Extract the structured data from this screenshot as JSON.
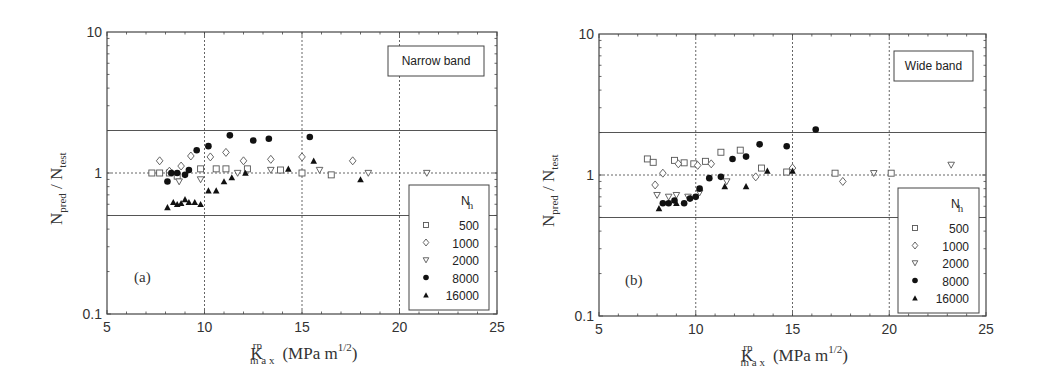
{
  "chart_data": [
    {
      "type": "scatter",
      "panel": "(a)",
      "annotation": "Narrow band",
      "xlabel": "K_max^rp (MPa m^1/2)",
      "ylabel": "N_pred / N_test",
      "xlim": [
        5,
        25
      ],
      "ylim": [
        0.1,
        10
      ],
      "yscale": "log",
      "xticks": [
        "5",
        "10",
        "15",
        "20",
        "25"
      ],
      "yticks": [
        "0.1",
        "1",
        "10"
      ],
      "grid": "dotted at x=10,15,20 and y=1",
      "reference_lines": [
        2,
        0.5
      ],
      "legend_title": "N_h",
      "legend_position": "lower right",
      "series": [
        {
          "name": "500",
          "marker": "open-square",
          "x": [
            7.3,
            7.7,
            8.2,
            8.6,
            9.8,
            10.6,
            11.1,
            12.2,
            13.9,
            15.0,
            16.5
          ],
          "y": [
            1.0,
            1.0,
            1.0,
            0.95,
            1.07,
            1.07,
            1.07,
            1.07,
            1.05,
            1.0,
            0.97
          ]
        },
        {
          "name": "1000",
          "marker": "open-diamond",
          "x": [
            7.7,
            8.2,
            8.8,
            9.3,
            10.3,
            11.1,
            12.0,
            13.4,
            15.0,
            17.6
          ],
          "y": [
            1.22,
            1.03,
            1.12,
            1.32,
            1.3,
            1.4,
            1.22,
            1.25,
            1.3,
            1.22
          ]
        },
        {
          "name": "2000",
          "marker": "open-triangle-down",
          "x": [
            8.7,
            9.8,
            11.7,
            13.4,
            15.9,
            18.4,
            21.4
          ],
          "y": [
            0.87,
            0.9,
            1.0,
            1.05,
            1.05,
            1.0,
            1.0
          ]
        },
        {
          "name": "8000",
          "marker": "filled-circle",
          "x": [
            8.1,
            8.3,
            8.6,
            9.0,
            9.2,
            9.6,
            10.2,
            11.3,
            12.5,
            13.3,
            15.4
          ],
          "y": [
            0.87,
            1.0,
            1.0,
            0.97,
            1.05,
            1.45,
            1.55,
            1.85,
            1.7,
            1.75,
            1.8
          ]
        },
        {
          "name": "16000",
          "marker": "filled-triangle-up",
          "x": [
            8.1,
            8.4,
            8.6,
            8.8,
            9.0,
            9.2,
            9.5,
            9.8,
            10.2,
            10.6,
            11.0,
            11.4,
            12.1,
            14.3,
            15.6,
            18.0
          ],
          "y": [
            0.57,
            0.62,
            0.6,
            0.61,
            0.65,
            0.62,
            0.62,
            0.6,
            0.75,
            0.75,
            0.87,
            0.93,
            1.0,
            1.07,
            1.22,
            0.9
          ]
        }
      ]
    },
    {
      "type": "scatter",
      "panel": "(b)",
      "annotation": "Wide band",
      "xlabel": "K_max^rp (MPa m^1/2)",
      "ylabel": "N_pred / N_test",
      "xlim": [
        5,
        25
      ],
      "ylim": [
        0.1,
        10
      ],
      "yscale": "log",
      "xticks": [
        "5",
        "10",
        "15",
        "20",
        "25"
      ],
      "yticks": [
        "0.1",
        "1",
        "10"
      ],
      "grid": "dotted at x=10,15,20 and y=1",
      "reference_lines": [
        2,
        0.5
      ],
      "legend_title": "N_h",
      "legend_position": "lower right",
      "series": [
        {
          "name": "500",
          "marker": "open-square",
          "x": [
            7.5,
            7.8,
            8.9,
            9.4,
            9.9,
            10.5,
            11.3,
            12.3,
            13.4,
            14.7,
            17.2,
            20.1
          ],
          "y": [
            1.3,
            1.23,
            1.27,
            1.22,
            1.2,
            1.25,
            1.45,
            1.5,
            1.12,
            1.05,
            1.03,
            1.03
          ]
        },
        {
          "name": "1000",
          "marker": "open-diamond",
          "x": [
            7.9,
            8.3,
            9.1,
            10.1,
            10.8,
            13.1,
            15.0,
            17.6
          ],
          "y": [
            0.85,
            1.03,
            1.2,
            1.17,
            1.2,
            0.97,
            1.12,
            0.9
          ]
        },
        {
          "name": "2000",
          "marker": "open-triangle-down",
          "x": [
            8.0,
            8.6,
            9.0,
            9.6,
            10.2,
            11.6,
            19.2,
            23.2
          ],
          "y": [
            0.72,
            0.7,
            0.72,
            0.7,
            0.75,
            0.9,
            1.03,
            1.18
          ]
        },
        {
          "name": "8000",
          "marker": "filled-circle",
          "x": [
            8.3,
            8.6,
            8.9,
            9.4,
            9.7,
            10.0,
            10.2,
            10.7,
            11.3,
            11.9,
            12.6,
            13.3,
            14.7,
            16.2
          ],
          "y": [
            0.63,
            0.63,
            0.66,
            0.63,
            0.68,
            0.7,
            0.8,
            0.95,
            0.97,
            1.3,
            1.35,
            1.65,
            1.6,
            2.1
          ]
        },
        {
          "name": "16000",
          "marker": "filled-triangle-up",
          "x": [
            8.1,
            9.0,
            11.5,
            12.6,
            13.7,
            15.0
          ],
          "y": [
            0.58,
            0.63,
            0.83,
            0.83,
            1.07,
            1.07
          ]
        }
      ]
    }
  ],
  "panels": [
    {
      "tag": "(a)",
      "annotation": "Narrow band",
      "ylabel_main": "N",
      "ylabel_sub1": "pred",
      "ylabel_sep": " / ",
      "ylabel_main2": "N",
      "ylabel_sub2": "test",
      "xlabel_main": "K",
      "xlabel_sup": "rp",
      "xlabel_sub": "m a x",
      "xlabel_units": "(MPa m",
      "xlabel_units_sup": "1/2",
      "xlabel_units_close": ")",
      "xticks": [
        "5",
        "10",
        "15",
        "20",
        "25"
      ],
      "yticks": [
        "0.1",
        "1",
        "10"
      ],
      "legend_title_main": "N",
      "legend_title_sub": "h",
      "legend_items": [
        "500",
        "1000",
        "2000",
        "8000",
        "16000"
      ]
    },
    {
      "tag": "(b)",
      "annotation": "Wide band",
      "ylabel_main": "N",
      "ylabel_sub1": "pred",
      "ylabel_sep": " / ",
      "ylabel_main2": "N",
      "ylabel_sub2": "test",
      "xlabel_main": "K",
      "xlabel_sup": "rp",
      "xlabel_sub": "m a x",
      "xlabel_units": "(MPa m",
      "xlabel_units_sup": "1/2",
      "xlabel_units_close": ")",
      "xticks": [
        "5",
        "10",
        "15",
        "20",
        "25"
      ],
      "yticks": [
        "0.1",
        "1",
        "10"
      ],
      "legend_title_main": "N",
      "legend_title_sub": "h",
      "legend_items": [
        "500",
        "1000",
        "2000",
        "8000",
        "16000"
      ]
    }
  ]
}
